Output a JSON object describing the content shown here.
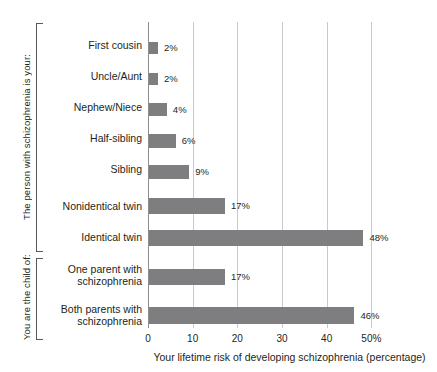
{
  "chart_data": {
    "type": "bar",
    "orientation": "horizontal",
    "title": "",
    "xlabel": "Your lifetime risk of developing schizophrenia (percentage)",
    "ylabel": "",
    "xlim": [
      0,
      60
    ],
    "xticks": [
      0,
      10,
      20,
      30,
      40,
      50
    ],
    "xtick_labels": [
      "0",
      "10",
      "20",
      "30",
      "40",
      "50%"
    ],
    "grid": true,
    "legend": false,
    "bar_color": "#7e7e80",
    "gridline_color": "#c9c9c9",
    "axis_color": "#8d8d8d",
    "categories": [
      "First cousin",
      "Uncle/Aunt",
      "Nephew/Niece",
      "Half-sibling",
      "Sibling",
      "Nonidentical twin",
      "Identical twin",
      "One parent with\nschizophrenia",
      "Both parents with\nschizophrenia"
    ],
    "values": [
      2,
      2,
      4,
      6,
      9,
      17,
      48,
      17,
      46
    ],
    "value_labels": [
      "2%",
      "2%",
      "4%",
      "6%",
      "9%",
      "17%",
      "48%",
      "17%",
      "46%"
    ],
    "groups": [
      {
        "label": "The person with schizophrenia is your:",
        "category_indices": [
          0,
          1,
          2,
          3,
          4,
          5,
          6
        ]
      },
      {
        "label": "You are the child of:",
        "category_indices": [
          7,
          8
        ]
      }
    ]
  }
}
